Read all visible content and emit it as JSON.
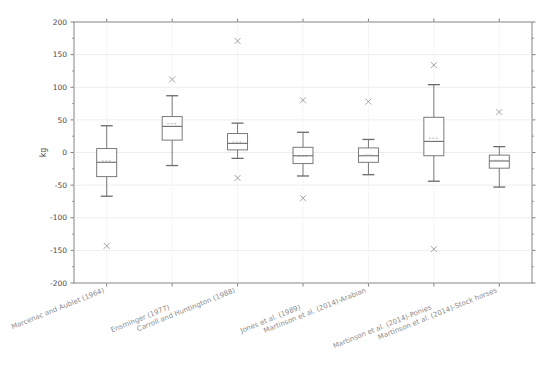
{
  "figure": {
    "background_color": "#ffffff",
    "plot_background_color": "#ffffff",
    "axis_color": "#777777",
    "grid_color": "#e8e8e8",
    "box_color": "#6b6b6b",
    "median_color": "#6b6b6b",
    "whisker_color": "#6b6b6b",
    "outlier_color": "#9a9a9a",
    "outlier_marker": "x-marker"
  },
  "chart_data": {
    "type": "box",
    "title": "",
    "xlabel": "",
    "ylabel": "kg",
    "ylim": [
      -200,
      200
    ],
    "yticks": [
      -200,
      -150,
      -100,
      -50,
      0,
      50,
      100,
      150,
      200
    ],
    "ytick_labels": [
      "-200",
      "-150",
      "-100",
      "-50",
      "0",
      "50",
      "100",
      "150",
      "200"
    ],
    "grid": true,
    "grid_axis": "y",
    "legend": null,
    "categories": [
      "Marcenac and Aublet (1964)",
      "Ensminger (1977)",
      "Carroll and Huntington (1988)",
      "Jones et al. (1989)",
      "Martinson et al. (2014)-Arabian",
      "Martinson et al. (2014)-Ponies",
      "Martinson et al. (2014)-Stock horses"
    ],
    "boxes": [
      {
        "label": "Marcenac and Aublet (1964)",
        "whisker_low": -67,
        "q1": -37,
        "median": -15,
        "mean": -13,
        "q3": 6,
        "whisker_high": 41,
        "outliers": [
          -143
        ]
      },
      {
        "label": "Ensminger (1977)",
        "whisker_low": -20,
        "q1": 19,
        "median": 40,
        "mean": 44,
        "q3": 55,
        "whisker_high": 87,
        "outliers": [
          112
        ]
      },
      {
        "label": "Carroll and Huntington (1988)",
        "whisker_low": -9,
        "q1": 4,
        "median": 14,
        "mean": 16,
        "q3": 29,
        "whisker_high": 45,
        "outliers": [
          171,
          -39
        ]
      },
      {
        "label": "Jones et al. (1989)",
        "whisker_low": -36,
        "q1": -17,
        "median": -5,
        "mean": -6,
        "q3": 8,
        "whisker_high": 31,
        "outliers": [
          80,
          -70
        ]
      },
      {
        "label": "Martinson et al. (2014)-Arabian",
        "whisker_low": -34,
        "q1": -15,
        "median": -5,
        "mean": -4,
        "q3": 7,
        "whisker_high": 20,
        "outliers": [
          78
        ]
      },
      {
        "label": "Martinson et al. (2014)-Ponies",
        "whisker_low": -44,
        "q1": -5,
        "median": 17,
        "mean": 22,
        "q3": 54,
        "whisker_high": 104,
        "outliers": [
          134,
          -148
        ]
      },
      {
        "label": "Martinson et al. (2014)-Stock horses",
        "whisker_low": -53,
        "q1": -24,
        "median": -13,
        "mean": -12,
        "q3": -4,
        "whisker_high": 9,
        "outliers": [
          62
        ]
      }
    ]
  }
}
